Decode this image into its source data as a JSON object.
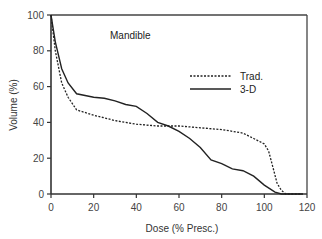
{
  "chart_data": {
    "type": "line",
    "title": "",
    "annotation": "Mandible",
    "xlabel": "Dose (% Presc.)",
    "ylabel": "Volume (%)",
    "xlim": [
      0,
      120
    ],
    "ylim": [
      0,
      100
    ],
    "xticks": [
      0,
      20,
      40,
      60,
      80,
      100,
      120
    ],
    "yticks": [
      0,
      20,
      40,
      60,
      80,
      100
    ],
    "grid": false,
    "legend_position": "upper right (inside plot)",
    "series": [
      {
        "name": "Trad.",
        "style": "dotted",
        "x": [
          0,
          2,
          5,
          8,
          12,
          20,
          30,
          40,
          50,
          60,
          70,
          80,
          85,
          90,
          95,
          100,
          102,
          104,
          106,
          108,
          110,
          118
        ],
        "y": [
          100,
          80,
          62,
          54,
          47,
          44,
          41,
          39,
          38,
          38,
          37,
          36,
          35,
          34,
          31,
          28,
          24,
          15,
          6,
          2,
          0,
          0
        ]
      },
      {
        "name": "3-D",
        "style": "solid",
        "x": [
          0,
          2,
          5,
          8,
          12,
          20,
          25,
          30,
          35,
          40,
          45,
          50,
          55,
          60,
          65,
          70,
          75,
          80,
          85,
          90,
          95,
          100,
          105,
          108,
          118
        ],
        "y": [
          100,
          85,
          70,
          62,
          56,
          54,
          53.5,
          52,
          50,
          49,
          45,
          40,
          38,
          35,
          31,
          26,
          19,
          17,
          14,
          13,
          10,
          5,
          1,
          0,
          0
        ]
      }
    ]
  },
  "labels": {
    "annotation": "Mandible",
    "xlabel": "Dose (% Presc.)",
    "ylabel": "Volume (%)",
    "legend_trad": "Trad.",
    "legend_3d": "3-D",
    "xtick_0": "0",
    "xtick_1": "20",
    "xtick_2": "40",
    "xtick_3": "60",
    "xtick_4": "80",
    "xtick_5": "100",
    "xtick_6": "120",
    "ytick_0": "0",
    "ytick_1": "20",
    "ytick_2": "40",
    "ytick_3": "60",
    "ytick_4": "80",
    "ytick_5": "100"
  }
}
